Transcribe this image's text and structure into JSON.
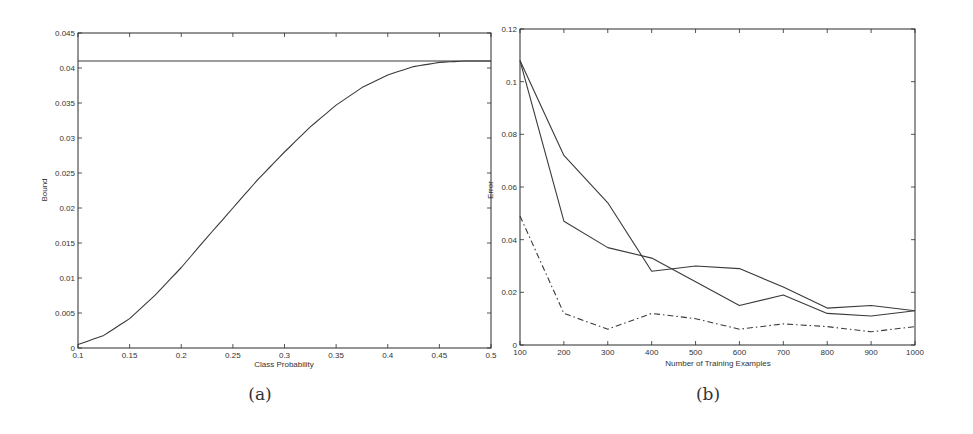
{
  "chart_data": [
    {
      "id": "a",
      "type": "line",
      "caption": "(a)",
      "title": "",
      "xlabel": "Class Probability",
      "ylabel": "Bound",
      "xlim": [
        0.1,
        0.5
      ],
      "ylim": [
        0,
        0.045
      ],
      "xticks": [
        "0.1",
        "0.15",
        "0.2",
        "0.25",
        "0.3",
        "0.35",
        "0.4",
        "0.45",
        "0.5"
      ],
      "yticks": [
        "0",
        "0.005",
        "0.01",
        "0.015",
        "0.02",
        "0.025",
        "0.03",
        "0.035",
        "0.04",
        "0.045"
      ],
      "grid": false,
      "legend": null,
      "series": [
        {
          "name": "constant bound",
          "style": "solid",
          "x": [
            0.1,
            0.5
          ],
          "values": [
            0.041,
            0.041
          ]
        },
        {
          "name": "bound curve",
          "style": "solid",
          "x": [
            0.1,
            0.125,
            0.15,
            0.175,
            0.2,
            0.225,
            0.25,
            0.275,
            0.3,
            0.325,
            0.35,
            0.375,
            0.4,
            0.425,
            0.45,
            0.475,
            0.5
          ],
          "values": [
            0.0005,
            0.0018,
            0.0042,
            0.0076,
            0.0115,
            0.0158,
            0.02,
            0.0242,
            0.028,
            0.0316,
            0.0347,
            0.0372,
            0.039,
            0.0402,
            0.0408,
            0.041,
            0.041
          ]
        }
      ]
    },
    {
      "id": "b",
      "type": "line",
      "caption": "(b)",
      "title": "",
      "xlabel": "Number of Training Examples",
      "ylabel": "Error",
      "xlim": [
        100,
        1000
      ],
      "ylim": [
        0,
        0.12
      ],
      "xticks": [
        "100",
        "200",
        "300",
        "400",
        "500",
        "600",
        "700",
        "800",
        "900",
        "1000"
      ],
      "yticks": [
        "0",
        "0.02",
        "0.04",
        "0.06",
        "0.08",
        "0.1",
        "0.12"
      ],
      "grid": false,
      "legend": null,
      "x": [
        100,
        200,
        300,
        400,
        500,
        600,
        700,
        800,
        900,
        1000
      ],
      "series": [
        {
          "name": "solid series 1",
          "style": "solid",
          "values": [
            0.108,
            0.047,
            0.037,
            0.033,
            0.024,
            0.015,
            0.019,
            0.012,
            0.011,
            0.013
          ]
        },
        {
          "name": "solid series 2",
          "style": "solid",
          "values": [
            0.108,
            0.072,
            0.054,
            0.028,
            0.03,
            0.029,
            0.022,
            0.014,
            0.015,
            0.013
          ]
        },
        {
          "name": "dash-dot series",
          "style": "dashdot",
          "values": [
            0.049,
            0.012,
            0.006,
            0.012,
            0.01,
            0.006,
            0.008,
            0.007,
            0.005,
            0.007
          ]
        }
      ]
    }
  ],
  "colors": {
    "axis": "#2b2b2b",
    "line": "#3a3a3a",
    "background": "#ffffff"
  }
}
